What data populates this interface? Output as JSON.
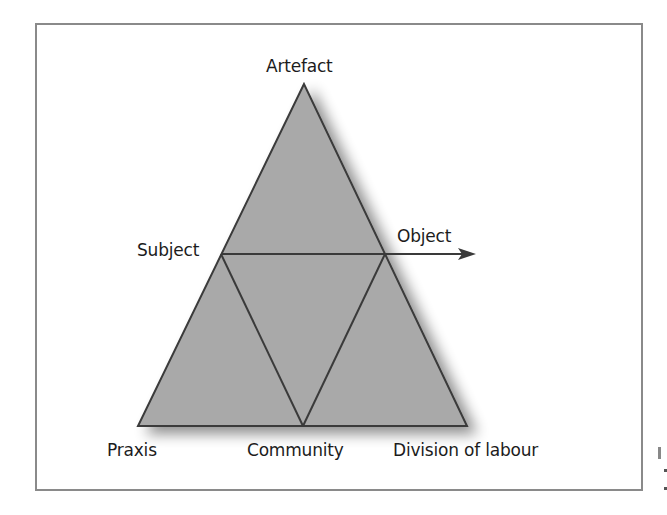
{
  "diagram": {
    "type": "activity-theory-triangle",
    "colors": {
      "fill": "#a9a9a9",
      "stroke": "#3a3a3a",
      "frame": "#8a8a8a",
      "text": "#1c1c1c",
      "shadow": "#9a9a9a"
    },
    "nodes": {
      "artefact": "Artefact",
      "subject": "Subject",
      "object": "Object",
      "praxis": "Praxis",
      "community": "Community",
      "division_of_labour": "Division of labour"
    },
    "edges": [
      {
        "from": "Artefact",
        "to": "Subject"
      },
      {
        "from": "Artefact",
        "to": "Object"
      },
      {
        "from": "Subject",
        "to": "Object"
      },
      {
        "from": "Subject",
        "to": "Praxis"
      },
      {
        "from": "Subject",
        "to": "Community"
      },
      {
        "from": "Object",
        "to": "Community"
      },
      {
        "from": "Object",
        "to": "Division of labour"
      },
      {
        "from": "Praxis",
        "to": "Community"
      },
      {
        "from": "Community",
        "to": "Division of labour"
      },
      {
        "from": "Object",
        "to": "outcome",
        "arrow": true
      }
    ]
  }
}
